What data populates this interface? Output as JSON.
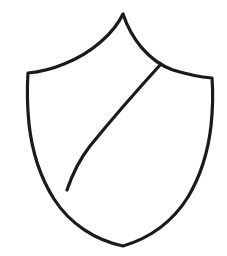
{
  "document": {
    "title": "Heraldic Shield Outline",
    "type": "line-drawing",
    "background_color": "#ffffff",
    "ink_color": "#1a1a1a",
    "canvas": {
      "width": 227,
      "height": 256
    }
  },
  "drawing": {
    "subject": "shield",
    "style": "hand-drawn black ink outline, uncolored",
    "stroke_color": "#1a1a1a",
    "stroke_width": 3.2,
    "fill_color": "#ffffff",
    "shapes": [
      {
        "name": "shield-outline",
        "description": "Pointed-top heraldic shield with concave upper curves meeting a central peak, straight-ish flared shoulders, and tapering sides converging to a point at the bottom.",
        "path": "M 123 14 C 114 33, 92 53, 64 64 C 52 69, 39 72, 28 73 C 27 88, 27 104, 29 124 C 32 151, 40 177, 54 199 C 70 224, 95 240, 123 246 C 150 238, 173 221, 188 197 C 200 177, 208 152, 211 126 C 213 107, 213 91, 212 78 C 200 77, 186 74, 173 70 C 148 61, 131 38, 123 14 Z"
      },
      {
        "name": "bend-divider-line",
        "description": "Single diagonal line (a bend) running from the upper-right edge of the shield down to the lower-left edge, dividing the field into two parts.",
        "path": "M 161 64 C 140 87, 112 119, 90 146 C 80 159, 72 175, 67 190"
      }
    ],
    "key_points": {
      "top_peak": {
        "x": 123,
        "y": 14
      },
      "top_left_shoulder": {
        "x": 28,
        "y": 73
      },
      "top_right_shoulder": {
        "x": 212,
        "y": 78
      },
      "bottom_point": {
        "x": 123,
        "y": 246
      },
      "bend_upper_end": {
        "x": 161,
        "y": 64
      },
      "bend_lower_end": {
        "x": 67,
        "y": 190
      }
    }
  }
}
